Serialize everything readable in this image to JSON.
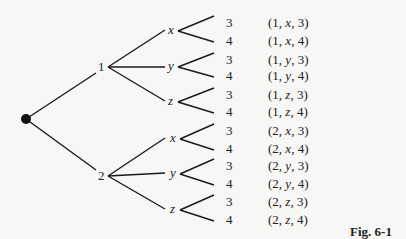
{
  "figure": {
    "caption": "Fig. 6-1",
    "root": {
      "x": 26,
      "y": 119
    },
    "level1": [
      {
        "label": "1",
        "x": 104,
        "y": 67,
        "lx": 98,
        "ly": 60
      },
      {
        "label": "2",
        "x": 104,
        "y": 176,
        "lx": 98,
        "ly": 169
      }
    ],
    "level2": [
      {
        "label": "x",
        "parent": 0,
        "x": 165,
        "y": 30,
        "lx": 168,
        "ly": 23
      },
      {
        "label": "y",
        "parent": 0,
        "x": 165,
        "y": 67,
        "lx": 168,
        "ly": 59
      },
      {
        "label": "z",
        "parent": 0,
        "x": 165,
        "y": 101,
        "lx": 168,
        "ly": 94
      },
      {
        "label": "x",
        "parent": 1,
        "x": 165,
        "y": 138,
        "lx": 170,
        "ly": 131
      },
      {
        "label": "y",
        "parent": 1,
        "x": 165,
        "y": 173,
        "lx": 170,
        "ly": 166
      },
      {
        "label": "z",
        "parent": 1,
        "x": 165,
        "y": 209,
        "lx": 170,
        "ly": 202
      }
    ],
    "leaves": [
      {
        "label": "3",
        "tuple": "(1, x, 3)",
        "parent": 0,
        "y": 20
      },
      {
        "label": "4",
        "tuple": "(1, x, 4)",
        "parent": 0,
        "y": 38
      },
      {
        "label": "3",
        "tuple": "(1, y, 3)",
        "parent": 1,
        "y": 57
      },
      {
        "label": "4",
        "tuple": "(1, y, 4)",
        "parent": 1,
        "y": 73
      },
      {
        "label": "3",
        "tuple": "(1, z, 3)",
        "parent": 2,
        "y": 92
      },
      {
        "label": "4",
        "tuple": "(1, z, 4)",
        "parent": 2,
        "y": 109
      },
      {
        "label": "3",
        "tuple": "(2, x, 3)",
        "parent": 3,
        "y": 128
      },
      {
        "label": "4",
        "tuple": "(2, x, 4)",
        "parent": 3,
        "y": 146
      },
      {
        "label": "3",
        "tuple": "(2, y, 3)",
        "parent": 4,
        "y": 163
      },
      {
        "label": "4",
        "tuple": "(2, y, 4)",
        "parent": 4,
        "y": 181
      },
      {
        "label": "3",
        "tuple": "(2, z, 3)",
        "parent": 5,
        "y": 199
      },
      {
        "label": "4",
        "tuple": "(2, z, 4)",
        "parent": 5,
        "y": 217
      }
    ],
    "tuple_parts": [
      [
        "1",
        "x",
        "3"
      ],
      [
        "1",
        "x",
        "4"
      ],
      [
        "1",
        "y",
        "3"
      ],
      [
        "1",
        "y",
        "4"
      ],
      [
        "1",
        "z",
        "3"
      ],
      [
        "1",
        "z",
        "4"
      ],
      [
        "2",
        "x",
        "3"
      ],
      [
        "2",
        "x",
        "4"
      ],
      [
        "2",
        "y",
        "3"
      ],
      [
        "2",
        "y",
        "4"
      ],
      [
        "2",
        "z",
        "3"
      ],
      [
        "2",
        "z",
        "4"
      ]
    ]
  }
}
